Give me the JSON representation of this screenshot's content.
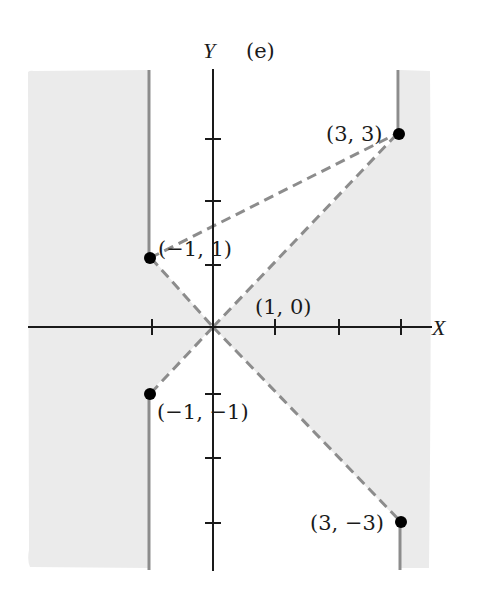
{
  "figure": {
    "panel_label": "(e)",
    "y_axis_label": "Y",
    "x_axis_label": "X",
    "colors": {
      "shade": "#ebebeb",
      "boundary": "#8c8c8c",
      "axis": "#1a1a1a",
      "point": "#000000"
    },
    "points": [
      {
        "id": "p1",
        "label": "(3, 3)",
        "x": 3,
        "y": 3
      },
      {
        "id": "p2",
        "label": "(−1, 1)",
        "x": -1,
        "y": 1
      },
      {
        "id": "p3",
        "label": "(1, 0)",
        "x": 1,
        "y": 0
      },
      {
        "id": "p4",
        "label": "(−1, −1)",
        "x": -1,
        "y": -1
      },
      {
        "id": "p5",
        "label": "(3, −3)",
        "x": 3,
        "y": -3
      }
    ]
  }
}
